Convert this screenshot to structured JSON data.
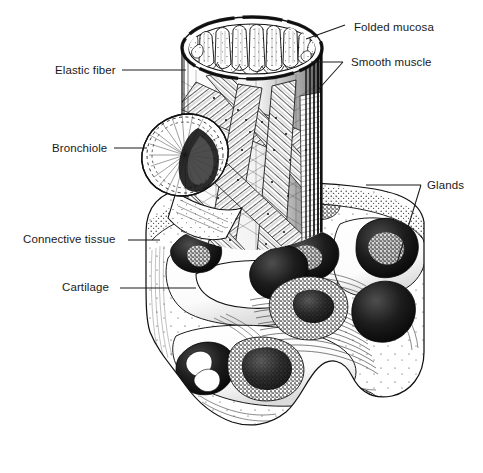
{
  "figure": {
    "kind": "anatomical-line-engraving",
    "background_color": "#ffffff",
    "ink_color": "#111111",
    "label_color": "#1a1a1a",
    "canvas": {
      "width": 483,
      "height": 473
    }
  },
  "labels": [
    {
      "id": "folded-mucosa",
      "text": "Folded mucosa",
      "text_x": 354,
      "text_y": 31,
      "anchor": "start",
      "leader": "M345,25 L306,39"
    },
    {
      "id": "smooth-muscle",
      "text": "Smooth muscle",
      "text_x": 351,
      "text_y": 66,
      "anchor": "start",
      "leader": "M311,62 L343,62 M343,62 L317,91"
    },
    {
      "id": "elastic-fiber",
      "text": "Elastic fiber",
      "text_x": 55,
      "text_y": 74,
      "anchor": "start",
      "leader": "M122,70 L186,70"
    },
    {
      "id": "bronchiole",
      "text": "Bronchiole",
      "text_x": 52,
      "text_y": 152,
      "anchor": "start",
      "leader": "M114,148 L147,148"
    },
    {
      "id": "glands",
      "text": "Glands",
      "text_x": 427,
      "text_y": 189,
      "anchor": "start",
      "leader": "M366,185 L421,185 M421,185 L397,263"
    },
    {
      "id": "connective-tissue",
      "text": "Connective tissue",
      "text_x": 23,
      "text_y": 243,
      "anchor": "start",
      "leader": "M128,240 L160,240"
    },
    {
      "id": "cartilage",
      "text": "Cartilage",
      "text_x": 62,
      "text_y": 291,
      "anchor": "start",
      "leader": "M120,288 L196,288"
    }
  ],
  "structures": {
    "upper_tube": {
      "name": "bronchus-tube",
      "top_ellipse_center": [
        252,
        48
      ],
      "top_ellipse_rx": 70,
      "top_ellipse_ry": 31,
      "left_x": 182,
      "right_x": 322,
      "bottom_y": 245,
      "mucosal_fold_count": 10
    },
    "bronchiole_stub": {
      "name": "bronchiole-branch",
      "center": [
        185,
        155
      ],
      "rx": 44,
      "ry": 40,
      "rotation_deg": -28,
      "ruffle_count": 30
    },
    "muscle_bands": {
      "name": "smooth-muscle-bands",
      "band_count": 7,
      "texture": "stippled-diagonal"
    },
    "cartilage_block": {
      "name": "cartilage-block",
      "left_x": 146,
      "right_x": 424,
      "top_y": 186,
      "bottom_y": 424,
      "plate_count": 3,
      "gland_count": 12
    }
  }
}
